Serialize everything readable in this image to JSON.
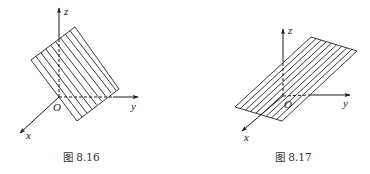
{
  "figures": [
    {
      "id": "fig-8-16",
      "caption": "图 8.16",
      "axes": {
        "x": "x",
        "y": "y",
        "z": "z",
        "origin": "O"
      },
      "origin": [
        59,
        97
      ],
      "z_end": [
        59,
        8
      ],
      "y_end": [
        138,
        97
      ],
      "x_end": [
        20,
        133
      ],
      "plane": {
        "corners": [
          [
            75,
            27
          ],
          [
            119,
            89
          ],
          [
            77,
            121
          ],
          [
            31,
            60
          ]
        ],
        "hatch_lines": 9
      },
      "description": "Plane parallel to the x-axis, hatched with lines parallel to the x direction"
    },
    {
      "id": "fig-8-17",
      "caption": "图 8.17",
      "axes": {
        "x": "x",
        "y": "y",
        "z": "z",
        "origin": "O"
      },
      "origin": [
        283,
        96
      ],
      "z_end": [
        283,
        29
      ],
      "y_end": [
        350,
        95
      ],
      "x_end": [
        242,
        131
      ],
      "plane": {
        "corners": [
          [
            311,
            37
          ],
          [
            357,
            51
          ],
          [
            282,
            121
          ],
          [
            235,
            107
          ]
        ],
        "hatch_lines": 9
      },
      "description": "Plane passing through the origin, hatched with lines parallel to its short edge"
    }
  ]
}
